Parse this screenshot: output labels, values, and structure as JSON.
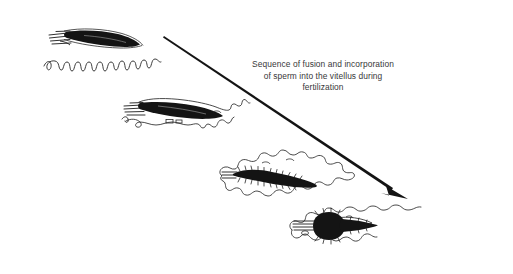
{
  "figure": {
    "title": "Sequence of fusion and incorporation of sperm into the vitellus during fertilization",
    "background_color": "#ffffff",
    "ink_color": "#1a1a1a",
    "text_color": "#38383a",
    "width": 513,
    "height": 274
  },
  "caption": {
    "line1": "Sequence of fusion and incorporation",
    "line2": "of sperm into the vitellus during",
    "line3": "fertilization"
  },
  "arrow": {
    "name": "sequence-direction-arrow",
    "from_x": 164,
    "from_y": 36,
    "to_x": 408,
    "to_y": 199,
    "color": "#1a1a1a"
  },
  "stages": [
    {
      "index": 1,
      "name": "stage-1-sperm-contact",
      "label": "Sperm approaching vitellus",
      "x": 48,
      "y": 24
    },
    {
      "index": 2,
      "name": "stage-2-sperm-fusion",
      "label": "Sperm fusing with vitellus surface",
      "x": 122,
      "y": 96
    },
    {
      "index": 3,
      "name": "stage-3-sperm-engulfment",
      "label": "Sperm engulfed by vitellus",
      "x": 210,
      "y": 150
    },
    {
      "index": 4,
      "name": "stage-4-sperm-incorporation",
      "label": "Sperm fully incorporated into vitellus",
      "x": 282,
      "y": 204
    }
  ]
}
